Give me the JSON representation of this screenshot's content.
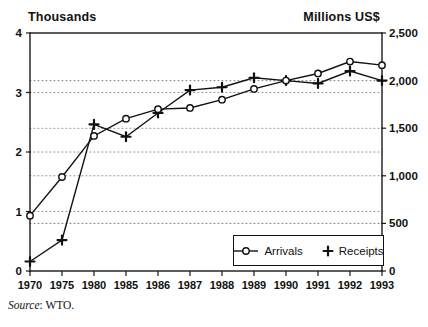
{
  "figure": {
    "left_axis_title": "Thousands",
    "right_axis_title": "Millions US$",
    "source_prefix": "Source",
    "source_rest": ": WTO."
  },
  "legend": {
    "items": [
      {
        "label": "Arrivals",
        "marker": "line-with-open-circle"
      },
      {
        "label": "Receipts",
        "marker": "plus"
      }
    ]
  },
  "chart_data": {
    "type": "line",
    "title": "",
    "categories": [
      "1970",
      "1975",
      "1980",
      "1985",
      "1986",
      "1987",
      "1988",
      "1989",
      "1990",
      "1991",
      "1992",
      "1993"
    ],
    "series": [
      {
        "name": "Arrivals",
        "axis": "left",
        "units": "thousands",
        "marker": "open-circle",
        "values": [
          0.93,
          1.58,
          2.27,
          2.56,
          2.72,
          2.74,
          2.88,
          3.06,
          3.2,
          3.32,
          3.52,
          3.46
        ]
      },
      {
        "name": "Receipts",
        "axis": "right",
        "units": "millions US$",
        "marker": "plus",
        "values": [
          100,
          325,
          1540,
          1410,
          1660,
          1900,
          1930,
          2030,
          2000,
          1970,
          2100,
          2000
        ]
      }
    ],
    "left_axis": {
      "title": "Thousands",
      "min": 0,
      "max": 4,
      "tick_values": [
        0,
        1,
        2,
        3,
        4
      ],
      "tick_labels": [
        "0",
        "1",
        "2",
        "3",
        "4"
      ]
    },
    "right_axis": {
      "title": "Millions US$",
      "min": 0,
      "max": 2500,
      "tick_values": [
        0,
        500,
        1000,
        1500,
        2000,
        2500
      ],
      "tick_labels": [
        "0",
        "500",
        "1,000",
        "1,500",
        "2,000",
        "2,500"
      ]
    },
    "gridlines": {
      "style": "dotted",
      "left_values": [
        1,
        2,
        3
      ],
      "right_values": [
        500,
        1000,
        1500,
        2000
      ]
    },
    "legend_position": "inside-bottom-right",
    "source": "Source: WTO."
  }
}
